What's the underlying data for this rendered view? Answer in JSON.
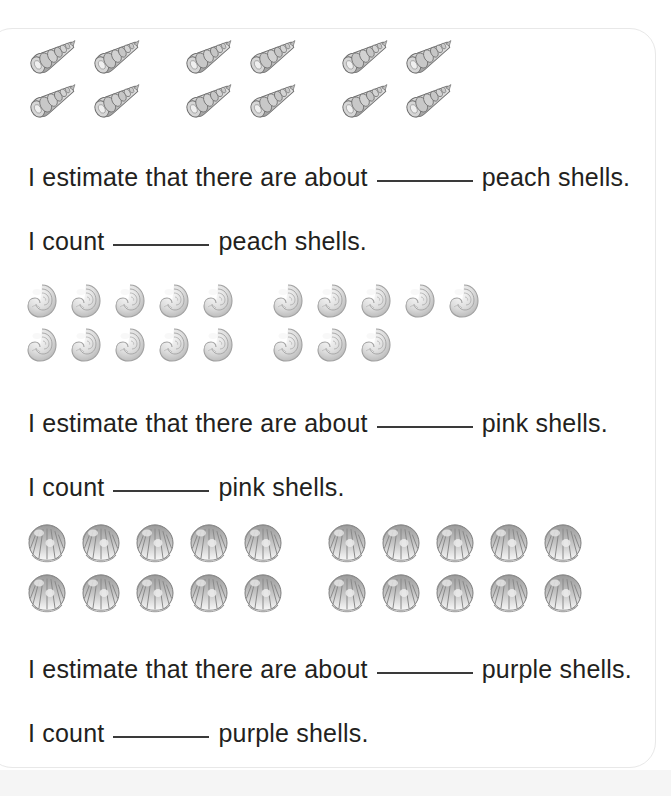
{
  "worksheet": {
    "background_color": "#ffffff",
    "text_color": "#231f20",
    "page_border_color": "#e8e8e8"
  },
  "sections": [
    {
      "id": "peach",
      "shell_name": "peach",
      "shell_type": "spiral-auger-shell",
      "shell_icon": "shell-spiral-icon",
      "total_count": 12,
      "rows": [
        {
          "groups": [
            2,
            2,
            2
          ]
        },
        {
          "groups": [
            2,
            2,
            2
          ]
        }
      ],
      "estimate_line": {
        "prefix": "I estimate that there are about",
        "suffix": "peach shells."
      },
      "count_line": {
        "prefix": "I count",
        "suffix": "peach shells."
      }
    },
    {
      "id": "pink",
      "shell_name": "pink",
      "shell_type": "snail-spiral-shell",
      "shell_icon": "shell-snail-icon",
      "total_count": 18,
      "rows": [
        {
          "groups": [
            5,
            5
          ]
        },
        {
          "groups": [
            5,
            3
          ]
        }
      ],
      "estimate_line": {
        "prefix": "I estimate that there are about",
        "suffix": "pink shells."
      },
      "count_line": {
        "prefix": "I count",
        "suffix": "pink shells."
      }
    },
    {
      "id": "purple",
      "shell_name": "purple",
      "shell_type": "scallop-clam-shell",
      "shell_icon": "shell-scallop-icon",
      "total_count": 20,
      "rows": [
        {
          "groups": [
            5,
            5
          ]
        },
        {
          "groups": [
            5,
            5
          ]
        }
      ],
      "estimate_line": {
        "prefix": "I estimate that there are about",
        "suffix": "purple shells."
      },
      "count_line": {
        "prefix": "I count",
        "suffix": "purple shells."
      }
    }
  ]
}
